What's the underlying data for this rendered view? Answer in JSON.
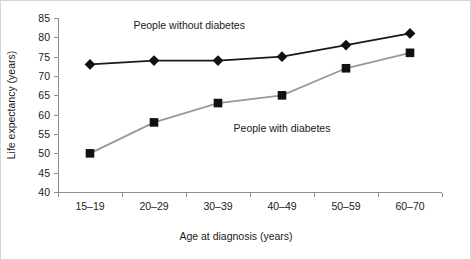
{
  "chart_data": {
    "type": "line",
    "title": "",
    "xlabel": "Age at diagnosis (years)",
    "ylabel": "Life expectancy (years)",
    "categories": [
      "15–19",
      "20–29",
      "30–39",
      "40–49",
      "50–59",
      "60–70"
    ],
    "ylim": [
      40,
      85
    ],
    "yticks": [
      40,
      45,
      50,
      55,
      60,
      65,
      70,
      75,
      80,
      85
    ],
    "ytick_labels": [
      "40",
      "45",
      "50",
      "55",
      "60",
      "65",
      "70",
      "75",
      "80",
      "85"
    ],
    "grid": false,
    "legend": "none",
    "series": [
      {
        "name": "People without diabetes",
        "values": [
          73,
          74,
          74,
          75,
          78,
          81
        ],
        "marker": "diamond",
        "marker_color": "#111111",
        "line_color": "#1a1a1a",
        "line_width": 1.8
      },
      {
        "name": "People with diabetes",
        "values": [
          50,
          58,
          63,
          65,
          72,
          76
        ],
        "marker": "square",
        "marker_color": "#111111",
        "line_color": "#999999",
        "line_width": 1.8
      }
    ],
    "annotations": [
      {
        "text": "People without diabetes",
        "x_category_index": 1.55,
        "y_value": 82.2
      },
      {
        "text": "People with diabetes",
        "x_category_index": 3.0,
        "y_value": 55.4
      }
    ]
  },
  "figure": {
    "border_color": "#d6d6d6",
    "background": "#ffffff",
    "axis_color": "#8c8c8c",
    "text_color": "#1a1a1a"
  }
}
